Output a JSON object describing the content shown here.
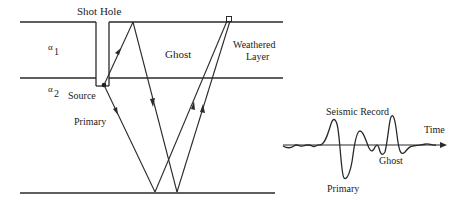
{
  "diagram": {
    "labels": {
      "shot_hole": "Shot Hole",
      "ghost": "Ghost",
      "weathered_line1": "Weathered",
      "weathered_line2": "Layer",
      "alpha1_symbol": "α",
      "alpha1_sub": "1",
      "alpha2_symbol": "α",
      "alpha2_sub": "2",
      "source": "Source",
      "primary": "Primary"
    },
    "seismic_record": {
      "title": "Seismic Record",
      "axis_label": "Time",
      "primary_label": "Primary",
      "ghost_label": "Ghost"
    },
    "colors": {
      "line": "#2a2a2a",
      "text": "#222222",
      "background": "#ffffff"
    }
  }
}
